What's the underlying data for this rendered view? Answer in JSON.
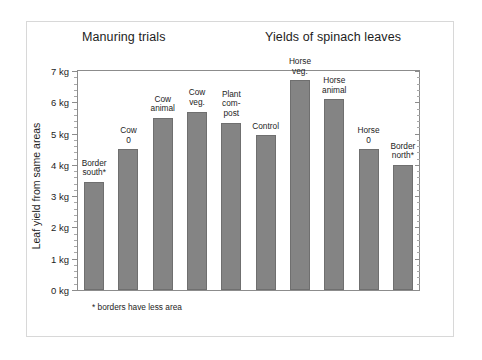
{
  "titles": {
    "left": "Manuring trials",
    "right": "Yields of spinach leaves"
  },
  "axis": {
    "y_title": "Leaf yield from same areas",
    "tick_labels": [
      "0 kg",
      "1 kg",
      "2 kg",
      "3 kg",
      "4 kg",
      "5 kg",
      "6 kg",
      "7 kg"
    ]
  },
  "footnote": "* borders have less area",
  "colors": {
    "bar_fill": "#848484",
    "bar_edge": "#6f6f6f",
    "axis": "#8c8c8c",
    "frame": "#d8d8d8",
    "text": "#1d1d1d",
    "background": "#ffffff"
  },
  "chart_data": {
    "type": "bar",
    "xlabel": "",
    "ylabel": "Leaf yield from same areas",
    "ylim": [
      0,
      7
    ],
    "yunit": "kg",
    "ytick_step": 1,
    "yminor_step": 0.2,
    "grid": false,
    "legend": "none",
    "annotations": [
      "* borders have less area"
    ],
    "categories": [
      "Border south*",
      "Cow 0",
      "Cow animal",
      "Cow veg.",
      "Plant compost",
      "Control",
      "Horse veg.",
      "Horse animal",
      "Horse 0",
      "Border north*"
    ],
    "category_labels_multiline": [
      "Border\nsouth*",
      "Cow\n0",
      "Cow\nanimal",
      "Cow\nveg.",
      "Plant\ncom-\npost",
      "Control",
      "Horse\nveg.",
      "Horse\nanimal",
      "Horse\n0",
      "Border\nnorth*"
    ],
    "values": [
      3.45,
      4.5,
      5.5,
      5.7,
      5.35,
      4.95,
      6.7,
      6.1,
      4.5,
      4.0
    ]
  }
}
